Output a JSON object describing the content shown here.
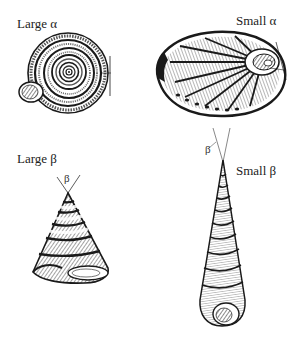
{
  "figure": {
    "panels": [
      {
        "id": "large-alpha",
        "label": "Large α",
        "shell": "planispiral (coiled, flat)"
      },
      {
        "id": "small-alpha",
        "label": "Small α",
        "shell": "abalone (ear-shaped)"
      },
      {
        "id": "large-beta",
        "label": "Large β",
        "shell": "trochus (conical top shell)",
        "angle_mark": "β"
      },
      {
        "id": "small-beta",
        "label": "Small β",
        "shell": "turritella (tall spire)",
        "angle_mark": "β"
      }
    ]
  },
  "colors": {
    "ink": "#1a1a1a",
    "background": "#ffffff"
  }
}
